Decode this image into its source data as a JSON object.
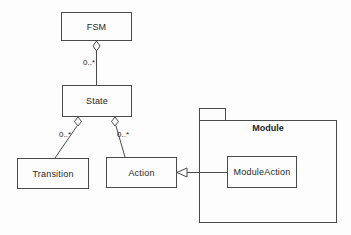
{
  "diagram": {
    "type": "uml-class-diagram",
    "background": "#fdfdfd",
    "line_color": "#4a4a4a",
    "text_color": "#1f1f1f",
    "classes": [
      {
        "id": "fsm",
        "label": "FSM"
      },
      {
        "id": "state",
        "label": "State"
      },
      {
        "id": "transition",
        "label": "Transition"
      },
      {
        "id": "action",
        "label": "Action"
      },
      {
        "id": "module-action",
        "label": "ModuleAction"
      }
    ],
    "package": {
      "label": "Module",
      "contains": [
        "ModuleAction"
      ]
    },
    "relations": [
      {
        "from": "FSM",
        "to": "State",
        "type": "aggregation",
        "multiplicity": "0..*"
      },
      {
        "from": "State",
        "to": "Transition",
        "type": "aggregation",
        "multiplicity": "0..*"
      },
      {
        "from": "State",
        "to": "Action",
        "type": "aggregation",
        "multiplicity": "0..*"
      },
      {
        "from": "ModuleAction",
        "to": "Action",
        "type": "generalization",
        "multiplicity": ""
      }
    ]
  }
}
